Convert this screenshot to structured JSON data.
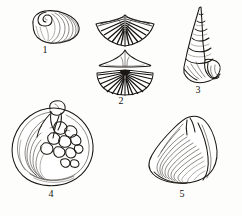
{
  "plate": {
    "title": "Fossil shell illustration plate",
    "background_color": "#fdfdfb",
    "ink_color": "#1a1712",
    "style": "black ink line engraving",
    "figure_count": 5
  },
  "figures": [
    {
      "number": "1",
      "name": "oval-bivalve-shell",
      "description": "Small oval bivalve valve with spiral umbo at upper left and concentric growth ridges fanning to the right",
      "views": 1,
      "x": 30,
      "y": 9,
      "width": 48,
      "height": 34,
      "label_x": 45,
      "label_y": 48
    },
    {
      "number": "2",
      "name": "winged-brachiopod-shell",
      "description": "Brachiopod shown in three views: winged dorsal valve with radial ribs, narrow triangular profile view, and broad fan-shaped valve with dense radial ribs",
      "views": 3,
      "x": 96,
      "y": 13,
      "width": 58,
      "height": 78,
      "label_x": 111,
      "label_y": 93
    },
    {
      "number": "3",
      "name": "conical-gastropod-shell",
      "description": "Tall high-spired conical gastropod (turret snail) with six whorls tapering to a sharp apex and an aperture on the body whorl at lower right",
      "views": 1,
      "x": 179,
      "y": 6,
      "width": 48,
      "height": 78,
      "label_x": 190,
      "label_y": 86
    },
    {
      "number": "4",
      "name": "round-bivalve-shell",
      "description": "Large rounded bivalve valve with prominent incurved beak at top, concentric growth lines at left and a cluster of rounded nodules across the centre",
      "views": 1,
      "x": 10,
      "y": 104,
      "width": 86,
      "height": 82,
      "label_x": 48,
      "label_y": 190
    },
    {
      "number": "5",
      "name": "triangular-venus-clam-shell",
      "description": "Triangular venus clam valve with pointed umbo at top and fine concentric growth ridges across the lower body",
      "views": 1,
      "x": 146,
      "y": 116,
      "width": 76,
      "height": 70,
      "label_x": 179,
      "label_y": 190
    }
  ]
}
